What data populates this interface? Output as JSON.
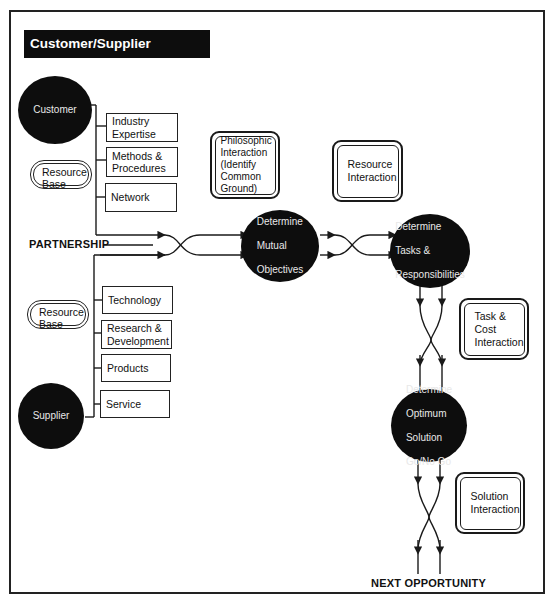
{
  "title": "Customer/Supplier Partnership",
  "nodes": {
    "customer": "Customer",
    "supplier": "Supplier",
    "mutual_objectives": [
      "Determine",
      "Mutual",
      "Objectives"
    ],
    "tasks_responsibilities": [
      "Determine",
      "Tasks &",
      "Responsibilities"
    ],
    "optimum_solution": [
      "Determine",
      "Optimum",
      "Solution",
      "Go/No Go"
    ]
  },
  "customer_resources": [
    [
      "Industry",
      "Expertise"
    ],
    [
      "Methods &",
      "Procedures"
    ],
    [
      "Network"
    ]
  ],
  "supplier_resources": [
    [
      "Technology"
    ],
    [
      "Research &",
      "Development"
    ],
    [
      "Products"
    ],
    [
      "Service"
    ]
  ],
  "resource_base_labels": {
    "customer": [
      "Resource",
      "Base"
    ],
    "supplier": [
      "Resource",
      "Base"
    ]
  },
  "interactions": {
    "philosophic": [
      "Philosophic",
      "Interaction",
      "(Identify",
      "Common",
      "Ground)"
    ],
    "resource": [
      "Resource",
      "Interaction"
    ],
    "task_cost": [
      "Task &",
      "Cost",
      "Interaction"
    ],
    "solution": [
      "Solution",
      "Interaction"
    ]
  },
  "labels": {
    "partnership": "PARTNERSHIP",
    "next_opportunity": "NEXT OPPORTUNITY"
  },
  "colors": {
    "node_fill": "#0d0d0d",
    "node_text": "#e8e8e8",
    "line": "#1a1a1a",
    "background": "#ffffff"
  }
}
